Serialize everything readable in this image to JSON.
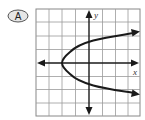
{
  "option": {
    "label": "A"
  },
  "graph": {
    "x_axis_label": "x",
    "y_axis_label": "y",
    "grid": {
      "columns": 8,
      "rows": 8
    },
    "curve": "parabola opening right, vertex at (-2, 0)",
    "colors": {
      "grid": "#9a9a9a",
      "axis": "#1a1a1a",
      "curve": "#1a1a1a"
    }
  }
}
